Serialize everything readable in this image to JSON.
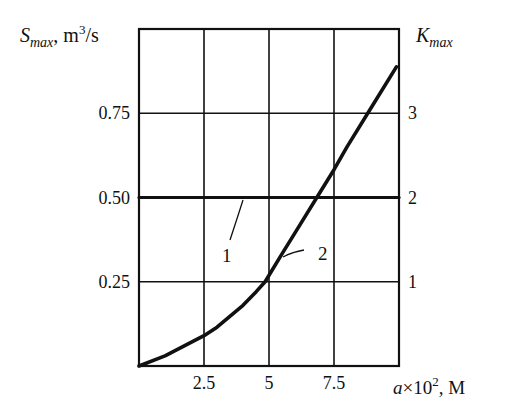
{
  "chart_data": {
    "type": "line",
    "title": "",
    "xlabel": "a×10², M",
    "ylabel_left": "S_max, m³/s",
    "ylabel_right": "K_max",
    "xlim": [
      0,
      10
    ],
    "ylim_left": [
      0,
      1.0
    ],
    "ylim_right": [
      0,
      4
    ],
    "grid": true,
    "x_ticks": [
      "2.5",
      "5",
      "7.5"
    ],
    "x_tick_values": [
      2.5,
      5,
      7.5
    ],
    "y_left_ticks": [
      "0.25",
      "0.50",
      "0.75"
    ],
    "y_left_tick_values": [
      0.25,
      0.5,
      0.75
    ],
    "y_right_ticks": [
      "1",
      "2",
      "3"
    ],
    "y_right_tick_values": [
      1,
      2,
      3
    ],
    "series": [
      {
        "name": "1",
        "axis": "left",
        "x": [
          0,
          10
        ],
        "values": [
          0.5,
          0.5
        ]
      },
      {
        "name": "2",
        "axis": "right",
        "x": [
          0,
          1,
          2,
          2.5,
          3,
          4,
          4.5,
          4.85,
          5.5,
          6,
          7,
          7.5,
          8,
          9,
          9.9
        ],
        "values": [
          0,
          0.12,
          0.28,
          0.36,
          0.46,
          0.72,
          0.88,
          1.0,
          1.33,
          1.58,
          2.08,
          2.33,
          2.6,
          3.1,
          3.55
        ]
      }
    ],
    "annotations": [
      {
        "text": "1",
        "target_series": "1"
      },
      {
        "text": "2",
        "target_series": "2"
      }
    ]
  },
  "labels": {
    "y_left_main": "S",
    "y_left_sub": "max",
    "y_left_unit": ", m",
    "y_left_sup": "3",
    "y_left_tail": "/s",
    "y_right_main": "K",
    "y_right_sub": "max",
    "x_italic": "a",
    "x_mid": "×10",
    "x_sup": "2",
    "x_tail": ", M",
    "curve1": "1",
    "curve2": "2"
  }
}
